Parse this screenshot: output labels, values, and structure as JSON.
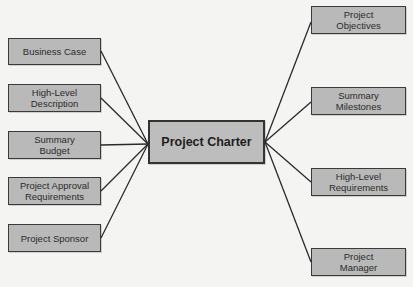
{
  "diagram": {
    "center": {
      "label": "Project Charter",
      "box": [
        148,
        120,
        117,
        44
      ],
      "anchor_left": [
        148,
        144
      ],
      "anchor_right": [
        265,
        142
      ]
    },
    "left_nodes": [
      {
        "label": "Business Case",
        "box": [
          8,
          38,
          93,
          27
        ],
        "anchor": [
          101,
          51
        ]
      },
      {
        "label": "High-Level\nDescription",
        "box": [
          8,
          84,
          93,
          28
        ],
        "anchor": [
          101,
          98
        ]
      },
      {
        "label": "Summary\nBudget",
        "box": [
          8,
          131,
          93,
          28
        ],
        "anchor": [
          101,
          145
        ]
      },
      {
        "label": "Project Approval\nRequirements",
        "box": [
          8,
          177,
          93,
          28
        ],
        "anchor": [
          101,
          191
        ]
      },
      {
        "label": "Project Sponsor",
        "box": [
          8,
          224,
          93,
          28
        ],
        "anchor": [
          101,
          238
        ]
      }
    ],
    "right_nodes": [
      {
        "label": "Project\nObjectives",
        "box": [
          311,
          6,
          95,
          28
        ],
        "anchor": [
          311,
          22
        ]
      },
      {
        "label": "Summary\nMilestones",
        "box": [
          311,
          87,
          95,
          28
        ],
        "anchor": [
          311,
          102
        ]
      },
      {
        "label": "High-Level\nRequirements",
        "box": [
          311,
          168,
          95,
          28
        ],
        "anchor": [
          311,
          182
        ]
      },
      {
        "label": "Project\nManager",
        "box": [
          311,
          248,
          95,
          28
        ],
        "anchor": [
          311,
          262
        ]
      }
    ],
    "colors": {
      "box_fill": "#b9b9b9",
      "border": "#3a3a3a",
      "line": "#2a2a2a",
      "background": "#f4f4f2"
    }
  }
}
